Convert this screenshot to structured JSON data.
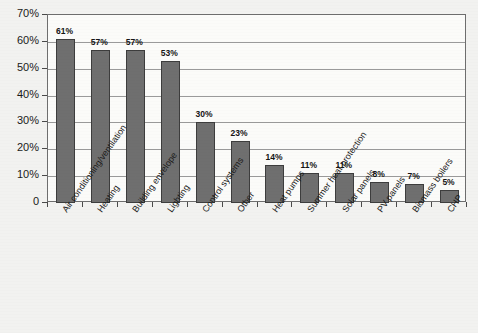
{
  "chart_data": {
    "type": "bar",
    "title": "",
    "subtitle": "",
    "xlabel": "",
    "ylabel": "",
    "ylim": [
      0,
      70
    ],
    "grid": true,
    "legend": false,
    "orientation": "vertical",
    "bar_color": "#6f6f6f",
    "bar_edge_color": "#3d3d3d",
    "plot_background": "#fbfbf9",
    "figure_background": "#f2f2f0",
    "grid_color": "#9a9a9a",
    "frame_color": "#6e6e6e",
    "categories": [
      "Air conditioning/ventilation",
      "Heating",
      "Building envelope",
      "Lighting",
      "Control systems",
      "Other",
      "Heat pumps",
      "Summer heat protection",
      "Solar panels",
      "PV panels",
      "Biomass boilers",
      "CHP"
    ],
    "values": [
      61,
      57,
      57,
      53,
      30,
      23,
      14,
      11,
      11,
      8,
      7,
      5
    ],
    "data_labels": [
      "61%",
      "57%",
      "57%",
      "53%",
      "30%",
      "23%",
      "14%",
      "11%",
      "11%",
      "8%",
      "7%",
      "5%"
    ],
    "y_ticks": [
      0,
      10,
      20,
      30,
      40,
      50,
      60,
      70
    ],
    "y_tick_labels": [
      "0",
      "10%",
      "20%",
      "30%",
      "40%",
      "50%",
      "60%",
      "70%"
    ]
  }
}
